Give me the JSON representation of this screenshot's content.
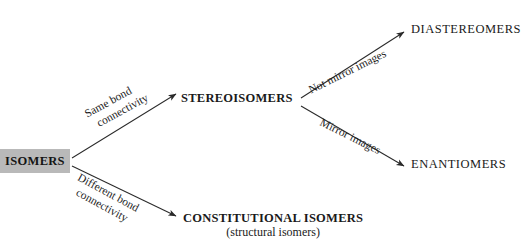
{
  "diagram": {
    "background_color": "#ffffff",
    "line_color": "#2a2a2a",
    "root_box_fill": "#b9b9b9",
    "root": {
      "label": "ISOMERS"
    },
    "nodes": {
      "stereoisomers": {
        "label": "STEREOISOMERS"
      },
      "constitutional": {
        "label": "CONSTITUTIONAL ISOMERS",
        "subtitle": "(structural isomers)"
      },
      "diastereomers": {
        "label": "DIASTEREOMERS"
      },
      "enantiomers": {
        "label": "ENANTIOMERS"
      }
    },
    "edge_labels": {
      "same_bond": {
        "line1": "Same bond",
        "line2": "connectivity"
      },
      "different_bond": {
        "line1": "Different bond",
        "line2": "connectivity"
      },
      "not_mirror": {
        "line1": "Not mirror images"
      },
      "mirror": {
        "line1": "Mirror images"
      }
    }
  }
}
